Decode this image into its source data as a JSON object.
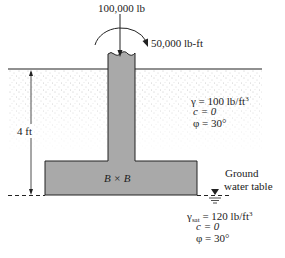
{
  "diagram": {
    "type": "shallow square footing with eccentric load",
    "loads": {
      "vertical_load": "100,000 lb",
      "moment": "50,000 lb-ft"
    },
    "dimensions": {
      "depth_label": "4 ft",
      "footing_label": "B × B"
    },
    "soil_above": {
      "gamma_line": "γ = 100 lb/ft",
      "gamma_exp": "3",
      "c_line": "c = 0",
      "phi_line": "φ = 30°"
    },
    "water_table": {
      "label_line1": "Ground",
      "label_line2": "water table"
    },
    "soil_below": {
      "gamma_symbol": "γ",
      "gamma_sub": "sat",
      "gamma_rest": " = 120 lb/ft",
      "gamma_exp": "3",
      "c_line": "c = 0",
      "phi_line": "φ = 30°"
    },
    "colors": {
      "concrete": "#a9a9a9",
      "lines": "#222222",
      "soil_dots": "#8a8a8a"
    }
  }
}
